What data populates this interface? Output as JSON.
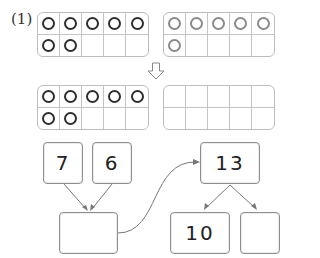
{
  "problem": {
    "label": "(1)",
    "top_frames": [
      {
        "filled": 7,
        "shade": "dark"
      },
      {
        "filled": 6,
        "shade": "light"
      }
    ],
    "down_arrow": "down-arrow",
    "bottom_frames": [
      {
        "filled": 7,
        "shade": "dark"
      },
      {
        "filled": 0,
        "shade": "empty"
      }
    ],
    "diagram": {
      "addend_a": "7",
      "addend_b": "6",
      "sum_box": "",
      "total": "13",
      "part_ten": "10",
      "part_rest": ""
    }
  },
  "colors": {
    "dark_circle": "#2e2e2e",
    "light_circle": "#8a8a8a",
    "grid_line": "#c4c4c4",
    "arrow": "#777777"
  }
}
